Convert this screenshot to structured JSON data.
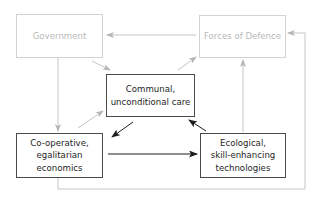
{
  "nodes": {
    "government": {
      "label": "Government",
      "style": "faded"
    },
    "forces": {
      "label": "Forces of Defence",
      "style": "faded"
    },
    "communal": {
      "label": "Communal,\nunconditional care",
      "style": "dark"
    },
    "cooperative": {
      "label": "Co-operative,\negalitarian\neconomics",
      "style": "dark"
    },
    "ecological": {
      "label": "Ecological,\nskill-enhancing\ntechnologies",
      "style": "dark"
    }
  },
  "edges": [
    {
      "from": "forces",
      "to": "government",
      "style": "faded"
    },
    {
      "from": "government",
      "to": "cooperative",
      "style": "faded"
    },
    {
      "from": "government",
      "to": "communal",
      "style": "faded"
    },
    {
      "from": "communal",
      "to": "forces",
      "style": "faded"
    },
    {
      "from": "cooperative",
      "to": "communal",
      "style": "faded"
    },
    {
      "from": "ecological",
      "to": "forces",
      "style": "faded"
    },
    {
      "from": "cooperative",
      "to": "forces",
      "style": "faded",
      "route": "bottom-right loop"
    },
    {
      "from": "communal",
      "to": "cooperative",
      "style": "dark"
    },
    {
      "from": "ecological",
      "to": "communal",
      "style": "dark"
    },
    {
      "from": "cooperative",
      "to": "ecological",
      "style": "dark"
    }
  ],
  "colors": {
    "faded": "#bdbdbd",
    "dark": "#1e1e1e"
  }
}
